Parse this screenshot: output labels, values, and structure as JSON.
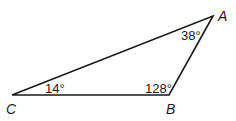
{
  "figure": {
    "type": "triangle",
    "stroke_color": "#1a1a1a",
    "background": "#ffffff",
    "vertices": [
      {
        "name": "A",
        "x": 213,
        "y": 16
      },
      {
        "name": "B",
        "x": 169,
        "y": 95
      },
      {
        "name": "C",
        "x": 12,
        "y": 95
      }
    ],
    "vertex_labels": {
      "A": "A",
      "B": "B",
      "C": "C"
    },
    "angles": {
      "A": "38°",
      "B": "128°",
      "C": "14°"
    }
  }
}
